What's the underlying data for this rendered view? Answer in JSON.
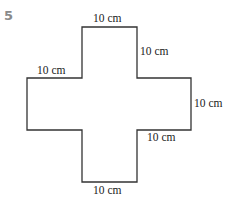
{
  "question_number": "5",
  "shape": {
    "type": "cross",
    "stroke_color": "#333333",
    "labels": {
      "top": "10 cm",
      "top_right_side": "10 cm",
      "left_arm_top": "10 cm",
      "right_arm_side": "10 cm",
      "right_arm_bottom": "10 cm",
      "bottom": "10 cm"
    }
  }
}
